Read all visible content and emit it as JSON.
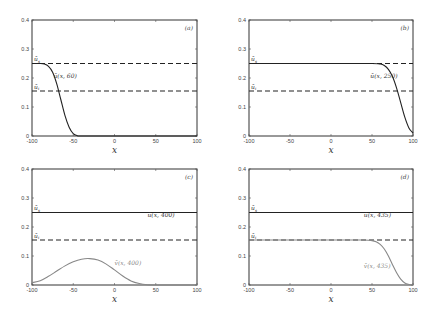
{
  "chart_data": [
    {
      "panel": "(a)",
      "type": "line",
      "xlabel": "x",
      "ylabel": "",
      "xlim": [
        -100,
        100
      ],
      "ylim": [
        0,
        0.4
      ],
      "xticks": [
        "-100",
        "-50",
        "0",
        "50",
        "100"
      ],
      "yticks": [
        "0",
        "0.1",
        "0.2",
        "0.3",
        "0.4"
      ],
      "grid": false,
      "reference_lines": [
        {
          "name": "ū_s",
          "y": 0.25,
          "style": "dashed"
        },
        {
          "name": "ū_i",
          "y": 0.155,
          "style": "dashed"
        }
      ],
      "series": [
        {
          "name": "ū(x, 60)",
          "color": "#222222",
          "x": [
            -100,
            -90,
            -85,
            -80,
            -75,
            -70,
            -65,
            -60,
            -55,
            -50,
            -45,
            -40,
            0,
            100
          ],
          "y": [
            0.25,
            0.25,
            0.248,
            0.24,
            0.22,
            0.18,
            0.125,
            0.07,
            0.03,
            0.008,
            0.001,
            0,
            0,
            0
          ]
        }
      ],
      "annotations": [
        "ū_s",
        "ū_i",
        "ū(x, 60)",
        "(a)"
      ]
    },
    {
      "panel": "(b)",
      "type": "line",
      "xlabel": "x",
      "xlim": [
        -100,
        100
      ],
      "ylim": [
        0,
        0.4
      ],
      "xticks": [
        "-100",
        "-50",
        "0",
        "50",
        "100"
      ],
      "yticks": [
        "0",
        "0.1",
        "0.2",
        "0.3",
        "0.4"
      ],
      "grid": false,
      "reference_lines": [
        {
          "name": "ū_s",
          "y": 0.25,
          "style": "dashed"
        },
        {
          "name": "ū_i",
          "y": 0.155,
          "style": "dashed"
        }
      ],
      "series": [
        {
          "name": "ū(x, 250)",
          "color": "#222222",
          "x": [
            -100,
            0,
            50,
            60,
            65,
            70,
            75,
            80,
            85,
            90,
            95,
            100
          ],
          "y": [
            0.25,
            0.25,
            0.25,
            0.248,
            0.243,
            0.23,
            0.205,
            0.165,
            0.115,
            0.065,
            0.028,
            0.01
          ]
        }
      ],
      "annotations": [
        "ū_s",
        "ū_i",
        "ū(x, 250)",
        "(b)"
      ]
    },
    {
      "panel": "(c)",
      "type": "line",
      "xlabel": "x",
      "xlim": [
        -100,
        100
      ],
      "ylim": [
        0,
        0.4
      ],
      "xticks": [
        "-100",
        "-50",
        "0",
        "50",
        "100"
      ],
      "yticks": [
        "0",
        "0.1",
        "0.2",
        "0.3",
        "0.4"
      ],
      "grid": false,
      "reference_lines": [
        {
          "name": "ū_s",
          "y": 0.25,
          "style": "solid"
        },
        {
          "name": "ū_i",
          "y": 0.155,
          "style": "dashed"
        }
      ],
      "series": [
        {
          "name": "ū(x, 400)",
          "color": "#222222",
          "x": [
            -100,
            100
          ],
          "y": [
            0.25,
            0.25
          ]
        },
        {
          "name": "v̄(x, 400)",
          "color": "#888888",
          "x": [
            -100,
            -90,
            -80,
            -70,
            -60,
            -50,
            -40,
            -30,
            -20,
            -10,
            0,
            10,
            20,
            30,
            40,
            50,
            100
          ],
          "y": [
            0.008,
            0.015,
            0.03,
            0.048,
            0.066,
            0.08,
            0.089,
            0.091,
            0.086,
            0.072,
            0.052,
            0.031,
            0.014,
            0.005,
            0.001,
            0,
            0
          ]
        }
      ],
      "annotations": [
        "ū_s",
        "ū_i",
        "ū(x, 400)",
        "v̄(x, 400)",
        "(c)"
      ]
    },
    {
      "panel": "(d)",
      "type": "line",
      "xlabel": "x",
      "xlim": [
        -100,
        100
      ],
      "ylim": [
        0,
        0.4
      ],
      "xticks": [
        "-100",
        "-50",
        "0",
        "50",
        "100"
      ],
      "yticks": [
        "0",
        "0.1",
        "0.2",
        "0.3",
        "0.4"
      ],
      "grid": false,
      "reference_lines": [
        {
          "name": "ū_s",
          "y": 0.25,
          "style": "solid"
        },
        {
          "name": "ū_i",
          "y": 0.155,
          "style": "dashed"
        }
      ],
      "series": [
        {
          "name": "ū(x, 435)",
          "color": "#222222",
          "x": [
            -100,
            100
          ],
          "y": [
            0.25,
            0.25
          ]
        },
        {
          "name": "v̄(x, 435)",
          "color": "#888888",
          "x": [
            -100,
            0,
            40,
            50,
            55,
            60,
            65,
            70,
            75,
            80,
            85,
            90,
            95,
            100
          ],
          "y": [
            0.155,
            0.155,
            0.155,
            0.153,
            0.149,
            0.14,
            0.124,
            0.1,
            0.07,
            0.042,
            0.02,
            0.007,
            0.002,
            0
          ]
        }
      ],
      "annotations": [
        "ū_s",
        "ū_i",
        "ū(x, 435)",
        "v̄(x, 435)",
        "(d)"
      ]
    }
  ],
  "labels": {
    "us": "ū",
    "us_sub": "s",
    "ui": "ū",
    "ui_sub": "i",
    "xlabel": "x",
    "panels": [
      "(a)",
      "(b)",
      "(c)",
      "(d)"
    ],
    "curves": [
      "ū(x, 60)",
      "ū(x, 250)",
      "ū(x, 400)",
      "v̄(x, 400)",
      "ū(x, 435)",
      "v̄(x, 435)"
    ],
    "xticks": [
      "-100",
      "-50",
      "0",
      "50",
      "100"
    ],
    "yticks": [
      "0",
      "0.1",
      "0.2",
      "0.3",
      "0.4"
    ]
  }
}
